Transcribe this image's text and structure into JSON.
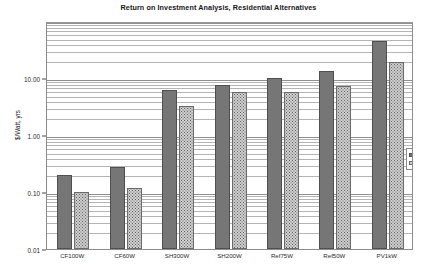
{
  "chart_data": {
    "type": "bar",
    "title": "Return on Investment Analysis, Residential Alternatives",
    "xlabel": "",
    "ylabel": "$/Watt, yrs",
    "yscale": "log",
    "ylim": [
      0.01,
      100
    ],
    "grid": true,
    "legend_position": "right-inside",
    "categories": [
      "CF100W",
      "CF60W",
      "SH300W",
      "SH200W",
      "Ref75W",
      "Ref50W",
      "PV1kW"
    ],
    "y_ticks": [
      {
        "value": 0.01,
        "label": "0.01"
      },
      {
        "value": 0.1,
        "label": "0.10"
      },
      {
        "value": 1,
        "label": "1.00"
      },
      {
        "value": 10,
        "label": "10.00"
      }
    ],
    "series": [
      {
        "name": "UIP, $/Wavg",
        "fill": "#767676",
        "values": [
          0.2,
          0.27,
          6.2,
          7.6,
          10.0,
          13.5,
          45.0
        ]
      },
      {
        "name": "ROC, yrs",
        "fill": "#cfcfcf",
        "values": [
          0.1,
          0.12,
          3.2,
          5.6,
          5.6,
          7.2,
          19.0
        ]
      }
    ]
  },
  "legend": {
    "items": [
      {
        "label": "UIP, $/Wavg"
      },
      {
        "label": "ROC, yrs"
      }
    ]
  },
  "colors": {
    "series_uip": "#767676",
    "series_roc": "#cfcfcf",
    "grid": "#b4b4b4",
    "frame": "#8c8c8c",
    "text": "#1a1a1a"
  }
}
